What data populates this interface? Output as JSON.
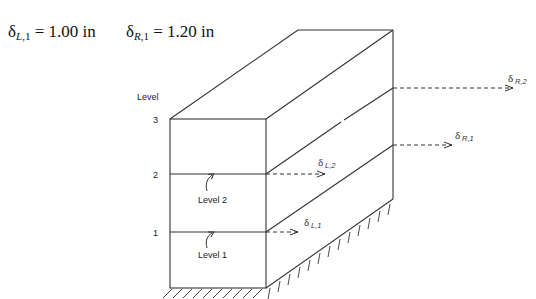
{
  "header": {
    "left_equation": {
      "symbol": "δ",
      "sub_letter": "L",
      "sub_index": ",1",
      "rest": " = 1.00 in"
    },
    "right_equation": {
      "symbol": "δ",
      "sub_letter": "R",
      "sub_index": ",1",
      "rest": "  = 1.20 in"
    }
  },
  "diagram": {
    "axis_title": "Level",
    "level_ticks": [
      "3",
      "2",
      "1"
    ],
    "floor_labels": [
      "Level 2",
      "Level 1"
    ],
    "displacements": [
      {
        "symbol": "δ",
        "sub": "R,2"
      },
      {
        "symbol": "δ",
        "sub": "R,1"
      },
      {
        "symbol": "δ",
        "sub": "L,2"
      },
      {
        "symbol": "δ",
        "sub": "L,1"
      }
    ],
    "colors": {
      "line": "#333333",
      "text": "#222222"
    }
  }
}
